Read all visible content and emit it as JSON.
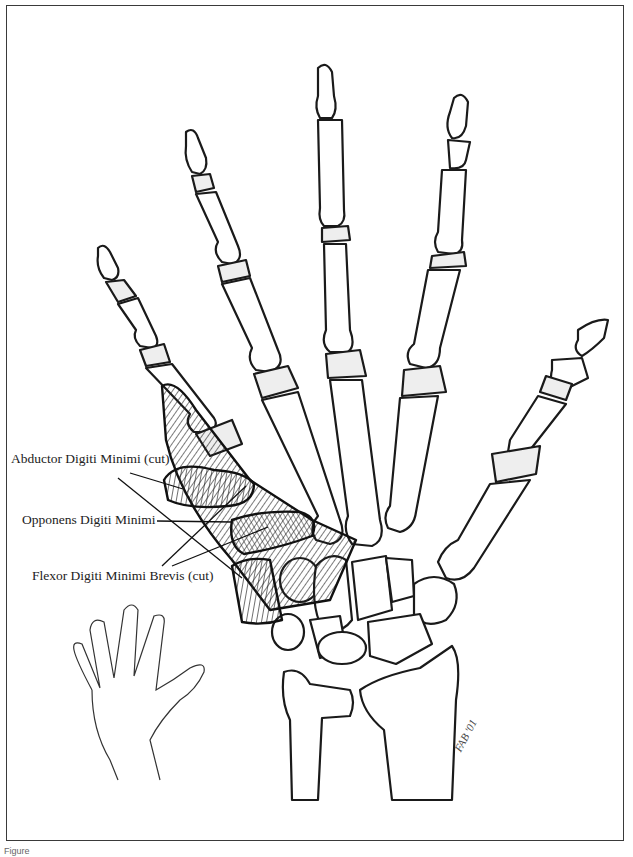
{
  "figure": {
    "labels": [
      {
        "id": "abductor",
        "text": "Abductor Digiti Minimi (cut)"
      },
      {
        "id": "opponens",
        "text": "Opponens Digiti Minimi"
      },
      {
        "id": "flexor",
        "text": "Flexor Digiti Minimi Brevis (cut)"
      }
    ],
    "signature": "FAB '01",
    "caption": "Figure"
  },
  "colors": {
    "ink": "#1a1a1a",
    "paper": "#ffffff",
    "frame": "#3a3a3a"
  }
}
